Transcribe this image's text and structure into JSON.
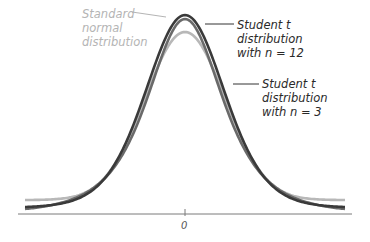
{
  "chart_data": {
    "type": "line",
    "title": "",
    "xlabel": "",
    "ylabel": "",
    "x_ticks": [
      "0"
    ],
    "grid": false,
    "legend_position": "inline annotations",
    "series": [
      {
        "name": "Standard normal distribution",
        "label_lines": [
          "Standard",
          "normal",
          "distribution"
        ],
        "color": "#b8b8b8",
        "kind": "normal",
        "peak_y_px": 32,
        "tail_y_px": 200
      },
      {
        "name": "Student t distribution with n = 12",
        "label_lines": [
          "Student t",
          "distribution",
          "with n = 12"
        ],
        "color": "#3a3a3a",
        "kind": "t",
        "df": 12,
        "peak_y_px": 15,
        "tail_y_px": 207
      },
      {
        "name": "Student t distribution with n = 3",
        "label_lines": [
          "Student t",
          "distribution",
          "with n = 3"
        ],
        "color": "#6a6a6a",
        "kind": "t",
        "df": 3,
        "peak_y_px": 19,
        "tail_y_px": 209
      }
    ],
    "x_range": [
      -4,
      4
    ],
    "axis": {
      "y_px": 214,
      "x_start_px": 18,
      "x_end_px": 352,
      "zero_px": 185
    }
  },
  "labels": {
    "normal": [
      "Standard",
      "normal",
      "distribution"
    ],
    "t12": [
      "Student t",
      "distribution",
      "with n = 12"
    ],
    "t3": [
      "Student t",
      "distribution",
      "with n = 3"
    ],
    "zero_tick": "0"
  }
}
